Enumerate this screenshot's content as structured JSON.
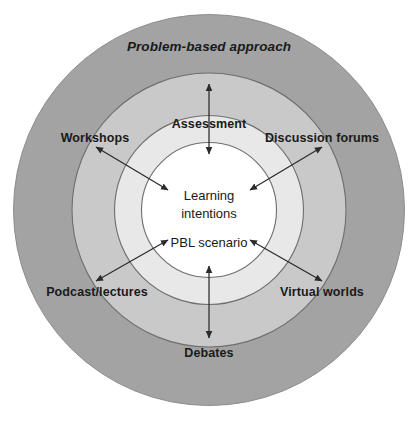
{
  "diagram": {
    "rings": [
      {
        "name": "outer-ring",
        "label": "Problem-based approach",
        "color": "#a3a3a3"
      },
      {
        "name": "middle-ring",
        "label": "",
        "color": "#c9c9c9"
      },
      {
        "name": "inner-ring",
        "label": "",
        "color": "#e8e8e8"
      },
      {
        "name": "core-circle",
        "label": "",
        "color": "#ffffff"
      }
    ],
    "outer_label": "Problem-based approach",
    "nodes": [
      {
        "id": "assessment",
        "label": "Assessment",
        "position": "top"
      },
      {
        "id": "workshops",
        "label": "Workshops",
        "position": "top-left"
      },
      {
        "id": "discussion-forums",
        "label": "Discussion forums",
        "position": "top-right"
      },
      {
        "id": "podcast-lectures",
        "label": "Podcast/lectures",
        "position": "bottom-left"
      },
      {
        "id": "virtual-worlds",
        "label": "Virtual worlds",
        "position": "bottom-right"
      },
      {
        "id": "debates",
        "label": "Debates",
        "position": "bottom"
      }
    ],
    "center": {
      "line1": "Learning",
      "line2": "intentions",
      "line3": "PBL scenario"
    },
    "arrows": [
      {
        "id": "arrow-assessment",
        "direction": "double",
        "orientation": "vertical-top"
      },
      {
        "id": "arrow-workshops",
        "direction": "double",
        "orientation": "diagonal-top-left"
      },
      {
        "id": "arrow-discussion-forums",
        "direction": "double",
        "orientation": "diagonal-top-right"
      },
      {
        "id": "arrow-podcast-lectures",
        "direction": "double",
        "orientation": "diagonal-bottom-left"
      },
      {
        "id": "arrow-virtual-worlds",
        "direction": "double",
        "orientation": "diagonal-bottom-right"
      },
      {
        "id": "arrow-debates",
        "direction": "double",
        "orientation": "vertical-bottom"
      }
    ],
    "colors": {
      "outer_ring": "#a3a3a3",
      "middle_ring": "#c9c9c9",
      "inner_ring": "#e8e8e8",
      "core": "#ffffff",
      "stroke": "#6e6e6e",
      "arrow": "#2b2b2b",
      "text": "#1a1a1a"
    }
  }
}
